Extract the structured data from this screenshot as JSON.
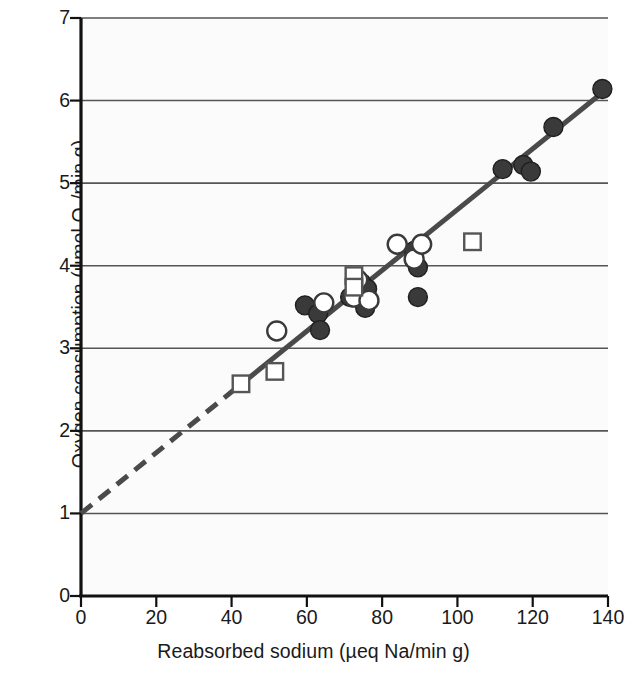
{
  "chart_data": {
    "type": "scatter",
    "title": "",
    "xlabel": "Reabsorbed sodium (µeq Na/min g)",
    "ylabel_plain": "Oxygen consumption (µmol O2/min g)",
    "ylabel_prefix": "Oxygen consumption (µmol O",
    "ylabel_sub": "2",
    "ylabel_suffix": "/min g)",
    "xlim": [
      0,
      140
    ],
    "ylim": [
      0,
      7
    ],
    "xticks": [
      0,
      20,
      40,
      60,
      80,
      100,
      120,
      140
    ],
    "yticks": [
      0,
      1,
      2,
      3,
      4,
      5,
      6,
      7
    ],
    "xtick_labels": [
      "0",
      "20",
      "40",
      "60",
      "80",
      "100",
      "120",
      "140"
    ],
    "ytick_labels": [
      "0",
      "1",
      "2",
      "3",
      "4",
      "5",
      "6",
      "7"
    ],
    "grid": "horizontal",
    "grid_color": "#555555",
    "plot_bg": "#fbfbfb",
    "legend": "none",
    "series": [
      {
        "name": "filled-circle",
        "marker": "filled-circle",
        "color": "#3a3a3a",
        "points": [
          [
            59.5,
            3.52
          ],
          [
            63.0,
            3.42
          ],
          [
            63.5,
            3.22
          ],
          [
            71.5,
            3.62
          ],
          [
            74.5,
            3.79
          ],
          [
            76.0,
            3.72
          ],
          [
            75.5,
            3.49
          ],
          [
            88.5,
            4.18
          ],
          [
            89.5,
            3.98
          ],
          [
            89.5,
            3.62
          ],
          [
            112.0,
            5.17
          ],
          [
            117.5,
            5.22
          ],
          [
            119.5,
            5.14
          ],
          [
            125.5,
            5.68
          ],
          [
            138.5,
            6.14
          ]
        ]
      },
      {
        "name": "open-circle",
        "marker": "open-circle",
        "color": "#3a3a3a",
        "points": [
          [
            52.0,
            3.21
          ],
          [
            64.5,
            3.55
          ],
          [
            72.5,
            3.62
          ],
          [
            73.5,
            3.83
          ],
          [
            76.5,
            3.58
          ],
          [
            84.0,
            4.26
          ],
          [
            88.5,
            4.08
          ],
          [
            90.5,
            4.26
          ]
        ]
      },
      {
        "name": "open-square",
        "marker": "open-square",
        "color": "#555555",
        "points": [
          [
            42.5,
            2.57
          ],
          [
            51.5,
            2.72
          ],
          [
            72.5,
            3.88
          ],
          [
            72.5,
            3.74
          ],
          [
            104.0,
            4.29
          ]
        ]
      }
    ],
    "fit_line": {
      "name": "regression-line",
      "color": "#4a4a4a",
      "width": 5,
      "intercept": 1.0,
      "slope": 0.0368,
      "x_start": 0,
      "x_end": 140,
      "dashed_from": 0,
      "dashed_to": 42,
      "solid_from": 42,
      "solid_to": 140
    }
  }
}
